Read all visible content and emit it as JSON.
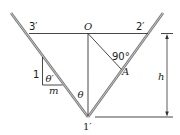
{
  "diagram": {
    "labels": {
      "point_3prime": "3′",
      "point_O": "O",
      "point_2prime": "2′",
      "point_1prime": "1′",
      "point_A": "A",
      "right_angle": "90°",
      "theta": "θ",
      "theta_prime": "θ′",
      "side_1": "1",
      "side_m": "m",
      "height_h": "h"
    },
    "colors": {
      "rod": "#8a8a8a",
      "line": "#333333",
      "text": "#1a1a1a"
    }
  }
}
